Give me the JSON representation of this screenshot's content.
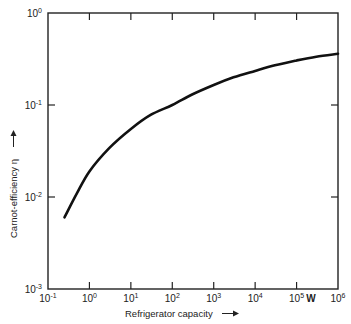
{
  "chart_data": {
    "type": "line",
    "title": "",
    "xlabel": "Refrigerator capacity",
    "ylabel": "Carnot-efficiency η",
    "x_unit": "W",
    "xscale": "log",
    "yscale": "log",
    "xlim": [
      0.1,
      1000000
    ],
    "ylim": [
      0.001,
      1
    ],
    "grid": false,
    "legend": null,
    "x_ticks": [
      {
        "base": "10",
        "exp": "-1",
        "value": 0.1
      },
      {
        "base": "10",
        "exp": "0",
        "value": 1
      },
      {
        "base": "10",
        "exp": "1",
        "value": 10
      },
      {
        "base": "10",
        "exp": "2",
        "value": 100
      },
      {
        "base": "10",
        "exp": "3",
        "value": 1000
      },
      {
        "base": "10",
        "exp": "4",
        "value": 10000
      },
      {
        "base": "10",
        "exp": "5",
        "value": 100000
      },
      {
        "base": "10",
        "exp": "6",
        "value": 1000000
      }
    ],
    "y_ticks": [
      {
        "base": "10",
        "exp": "0",
        "value": 1
      },
      {
        "base": "10",
        "exp": "-1",
        "value": 0.1
      },
      {
        "base": "10",
        "exp": "-2",
        "value": 0.01
      },
      {
        "base": "10",
        "exp": "-3",
        "value": 0.001
      }
    ],
    "series": [
      {
        "name": "Carnot efficiency",
        "x": [
          0.25,
          0.5,
          1,
          3,
          10,
          30,
          100,
          300,
          1000,
          3000,
          10000,
          30000,
          100000,
          300000,
          1000000
        ],
        "y": [
          0.006,
          0.011,
          0.019,
          0.034,
          0.055,
          0.078,
          0.1,
          0.13,
          0.165,
          0.2,
          0.235,
          0.27,
          0.305,
          0.335,
          0.36
        ]
      }
    ]
  },
  "labels": {
    "xlabel": "Refrigerator capacity",
    "ylabel": "Carnot-efficiency η",
    "unit": "W"
  }
}
